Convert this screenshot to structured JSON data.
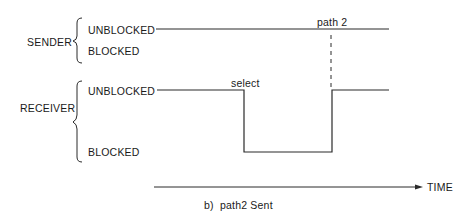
{
  "sender": {
    "label": "SENDER",
    "states": {
      "unblocked": "UNBLOCKED",
      "blocked": "BLOCKED"
    }
  },
  "receiver": {
    "label": "RECEIVER",
    "states": {
      "unblocked": "UNBLOCKED",
      "blocked": "BLOCKED"
    }
  },
  "annotations": {
    "select": "select",
    "path2": "path 2"
  },
  "axis": {
    "label": "TIME"
  },
  "caption": "b)  path2 Sent",
  "colors": {
    "line": "#2a2a2a",
    "text": "#1a1a1a",
    "background": "#ffffff"
  }
}
